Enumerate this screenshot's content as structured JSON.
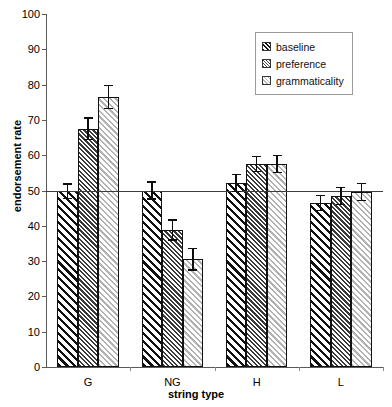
{
  "chart_data": {
    "type": "bar",
    "title": "",
    "xlabel": "string type",
    "ylabel": "endorsement rate",
    "categories": [
      "G",
      "NG",
      "H",
      "L"
    ],
    "ylim": [
      0,
      100
    ],
    "yticks": [
      0,
      10,
      20,
      30,
      40,
      50,
      60,
      70,
      80,
      90,
      100
    ],
    "grid": false,
    "legend_position": "top-right",
    "reference_line": 50,
    "series": [
      {
        "name": "baseline",
        "values": [
          49.8,
          50.0,
          52.2,
          46.5
        ],
        "errors": [
          2.2,
          2.6,
          2.6,
          2.3
        ]
      },
      {
        "name": "preference",
        "values": [
          67.5,
          38.8,
          57.5,
          48.5
        ],
        "errors": [
          3.2,
          3.0,
          2.4,
          2.6
        ]
      },
      {
        "name": "grammaticality",
        "values": [
          76.5,
          30.5,
          57.5,
          49.5
        ],
        "errors": [
          3.5,
          3.2,
          2.6,
          2.6
        ]
      }
    ]
  },
  "legend": {
    "items": [
      {
        "label": "baseline"
      },
      {
        "label": "preference"
      },
      {
        "label": "grammaticality"
      }
    ]
  }
}
